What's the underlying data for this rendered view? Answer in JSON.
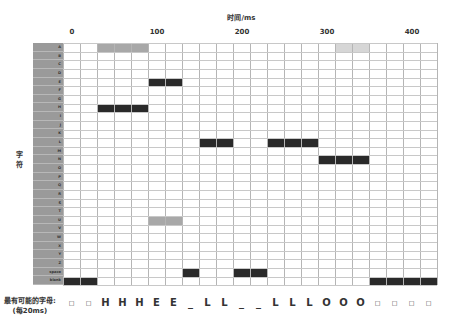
{
  "chart_data": {
    "type": "heatmap",
    "title": "",
    "xlabel": "时间/ms",
    "ylabel": "字符",
    "x_ticks": [
      {
        "label": "0",
        "value": 0
      },
      {
        "label": "100",
        "value": 100
      },
      {
        "label": "200",
        "value": 200
      },
      {
        "label": "300",
        "value": 300
      },
      {
        "label": "400",
        "value": 400
      }
    ],
    "time_step_ms": 20,
    "num_columns": 22,
    "rows": [
      "A",
      "B",
      "C",
      "D",
      "E",
      "F",
      "G",
      "H",
      "I",
      "J",
      "K",
      "L",
      "M",
      "N",
      "O",
      "P",
      "Q",
      "R",
      "S",
      "T",
      "U",
      "V",
      "W",
      "X",
      "Y",
      "Z",
      "<space>",
      "<blank>"
    ],
    "cells": [
      {
        "row": "A",
        "cols": [
          2,
          3,
          4
        ],
        "intensity": "medium"
      },
      {
        "row": "A",
        "cols": [
          16,
          17
        ],
        "intensity": "light"
      },
      {
        "row": "E",
        "cols": [
          5,
          6
        ],
        "intensity": "high"
      },
      {
        "row": "H",
        "cols": [
          2,
          3,
          4
        ],
        "intensity": "high"
      },
      {
        "row": "L",
        "cols": [
          8,
          9
        ],
        "intensity": "high"
      },
      {
        "row": "L",
        "cols": [
          12,
          13,
          14
        ],
        "intensity": "high"
      },
      {
        "row": "N",
        "cols": [
          15,
          16,
          17
        ],
        "intensity": "high"
      },
      {
        "row": "U",
        "cols": [
          5,
          6
        ],
        "intensity": "medium"
      },
      {
        "row": "<space>",
        "cols": [
          7
        ],
        "intensity": "high"
      },
      {
        "row": "<space>",
        "cols": [
          10,
          11
        ],
        "intensity": "high"
      },
      {
        "row": "<blank>",
        "cols": [
          0,
          1
        ],
        "intensity": "high"
      },
      {
        "row": "<blank>",
        "cols": [
          18,
          19,
          20,
          21
        ],
        "intensity": "high"
      }
    ],
    "intensity_colors": {
      "high": "#2a2a2a",
      "medium": "#a8a8a8",
      "light": "#d6d6d6"
    },
    "most_likely_sequence": [
      "□",
      "□",
      "H",
      "H",
      "H",
      "E",
      "E",
      "_",
      "L",
      "L",
      "_",
      "_",
      "L",
      "L",
      "L",
      "O",
      "O",
      "O",
      "□",
      "□",
      "□",
      "□"
    ]
  },
  "header": {
    "x_title": "时间/ms"
  },
  "axis": {
    "y_title_line1": "字",
    "y_title_line2": "符"
  },
  "footer": {
    "label_line1": "最有可能的字母:",
    "label_line2": "(每20ms)"
  }
}
